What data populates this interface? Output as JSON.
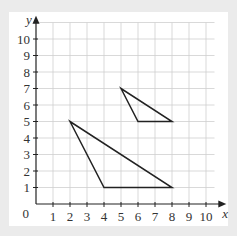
{
  "chart_data": {
    "type": "coordinate-grid",
    "xlabel": "x",
    "ylabel": "y",
    "origin_label": "0",
    "xlim": [
      0,
      10
    ],
    "ylim": [
      0,
      10
    ],
    "x_ticks": [
      "1",
      "2",
      "3",
      "4",
      "5",
      "6",
      "7",
      "8",
      "9",
      "10"
    ],
    "y_ticks": [
      "1",
      "2",
      "3",
      "4",
      "5",
      "6",
      "7",
      "8",
      "9",
      "10"
    ],
    "grid": true,
    "shapes": [
      {
        "name": "small-triangle",
        "vertices": [
          [
            5,
            7
          ],
          [
            6,
            5
          ],
          [
            8,
            5
          ]
        ]
      },
      {
        "name": "large-triangle",
        "vertices": [
          [
            2,
            5
          ],
          [
            4,
            1
          ],
          [
            8,
            1
          ]
        ]
      }
    ]
  },
  "colors": {
    "background": "#ebebeb",
    "card": "#ffffff",
    "grid": "#cfcfcf",
    "axis": "#222222",
    "shape": "#222222"
  }
}
